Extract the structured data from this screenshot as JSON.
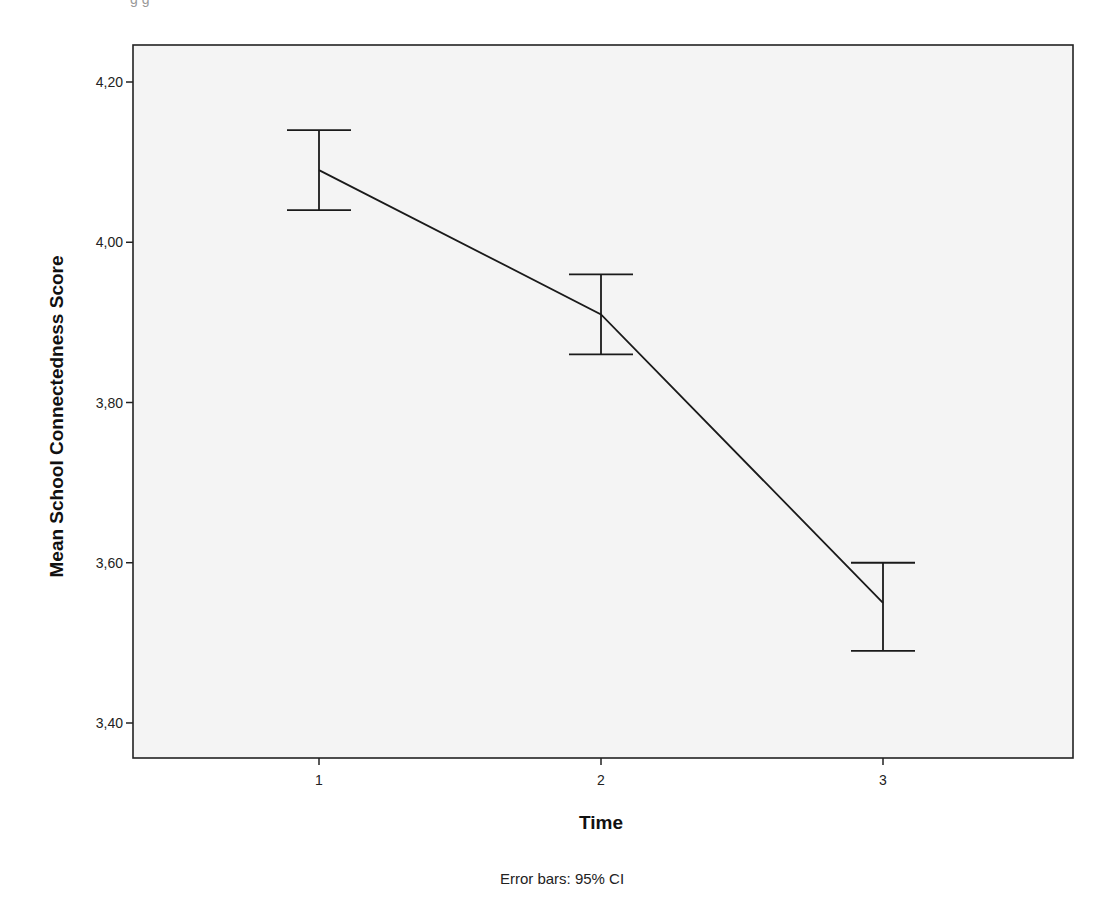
{
  "chart_data": {
    "type": "line",
    "title": "",
    "xlabel": "Time",
    "ylabel": "Mean School Connectedness Score",
    "footnote": "Error bars: 95% CI",
    "categories": [
      "1",
      "2",
      "3"
    ],
    "series": [
      {
        "name": "Mean School Connectedness Score",
        "values": [
          4.09,
          3.91,
          3.55
        ],
        "ci_upper": [
          4.14,
          3.96,
          3.6
        ],
        "ci_lower": [
          4.04,
          3.86,
          3.49
        ]
      }
    ],
    "ylim": [
      3.35,
      4.25
    ],
    "yticks": [
      3.4,
      3.6,
      3.8,
      4.0,
      4.2
    ],
    "ytick_labels": [
      "3,40",
      "3,60",
      "3,80",
      "4,00",
      "4,20"
    ],
    "grid": false,
    "legend": "none",
    "colors": {
      "line": "#1a1a1a",
      "plot_background": "#f4f4f4",
      "frame": "#222222"
    }
  },
  "top_fragment": "g g"
}
